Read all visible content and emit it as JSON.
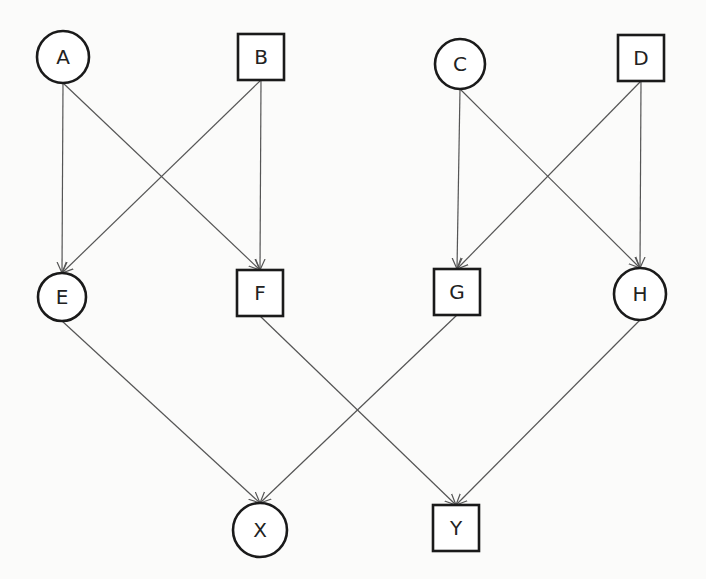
{
  "diagram": {
    "colors": {
      "stroke": "#1a1a1a",
      "edge": "#555555",
      "background": "#fbfbfa",
      "node_fill": "#ffffff"
    },
    "nodes": [
      {
        "id": "A",
        "label": "A",
        "shape": "circle",
        "x": 63,
        "y": 57,
        "r": 26
      },
      {
        "id": "B",
        "label": "B",
        "shape": "square",
        "x": 261,
        "y": 57,
        "size": 46
      },
      {
        "id": "C",
        "label": "C",
        "shape": "circle",
        "x": 460,
        "y": 64,
        "r": 25
      },
      {
        "id": "D",
        "label": "D",
        "shape": "square",
        "x": 641,
        "y": 58,
        "size": 46
      },
      {
        "id": "E",
        "label": "E",
        "shape": "circle",
        "x": 62,
        "y": 297,
        "r": 24
      },
      {
        "id": "F",
        "label": "F",
        "shape": "square",
        "x": 260,
        "y": 293,
        "size": 46
      },
      {
        "id": "G",
        "label": "G",
        "shape": "square",
        "x": 457,
        "y": 292,
        "size": 46
      },
      {
        "id": "H",
        "label": "H",
        "shape": "circle",
        "x": 640,
        "y": 294,
        "r": 26
      },
      {
        "id": "X",
        "label": "X",
        "shape": "circle",
        "x": 260,
        "y": 530,
        "r": 27
      },
      {
        "id": "Y",
        "label": "Y",
        "shape": "square",
        "x": 456,
        "y": 528,
        "size": 46
      }
    ],
    "edges": [
      {
        "from": "A",
        "to": "E"
      },
      {
        "from": "A",
        "to": "F"
      },
      {
        "from": "B",
        "to": "E"
      },
      {
        "from": "B",
        "to": "F"
      },
      {
        "from": "C",
        "to": "G"
      },
      {
        "from": "C",
        "to": "H"
      },
      {
        "from": "D",
        "to": "G"
      },
      {
        "from": "D",
        "to": "H"
      },
      {
        "from": "E",
        "to": "X"
      },
      {
        "from": "G",
        "to": "X"
      },
      {
        "from": "F",
        "to": "Y"
      },
      {
        "from": "H",
        "to": "Y"
      }
    ]
  }
}
